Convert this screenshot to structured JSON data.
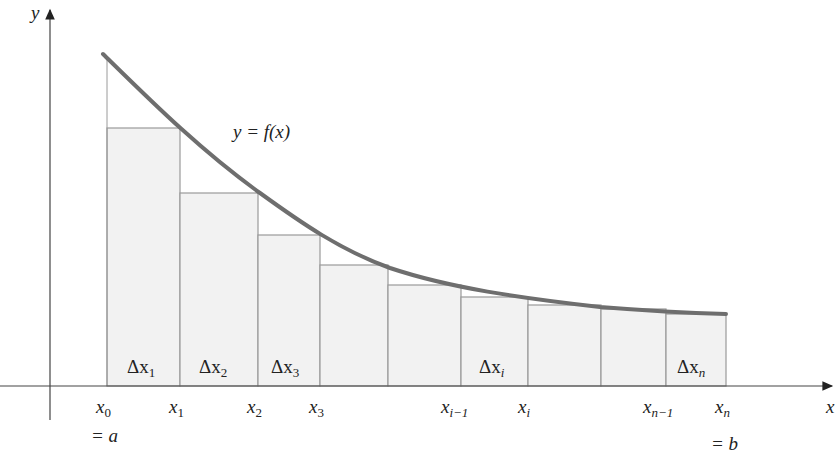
{
  "diagram": {
    "type": "riemann-sum-right-endpoints",
    "curve_label": "y = f(x)",
    "axes": {
      "x_label": "x",
      "y_label": "y"
    },
    "colors": {
      "curve": "#6e6e6e",
      "rect_fill": "#f2f2f2",
      "rect_stroke": "#9a9a9a",
      "axis": "#555555"
    },
    "partition_ticks": [
      {
        "base": "x",
        "sub": "0"
      },
      {
        "base": "x",
        "sub": "1"
      },
      {
        "base": "x",
        "sub": "2"
      },
      {
        "base": "x",
        "sub": "3"
      },
      {
        "base": "x",
        "sub": "i−1"
      },
      {
        "base": "x",
        "sub": "i"
      },
      {
        "base": "x",
        "sub": "n−1"
      },
      {
        "base": "x",
        "sub": "n"
      }
    ],
    "endpoint_notes": {
      "left": "= a",
      "right": "= b"
    },
    "width_labels": [
      {
        "text": "Δx",
        "sub": "1"
      },
      {
        "text": "Δx",
        "sub": "2"
      },
      {
        "text": "Δx",
        "sub": "3"
      },
      {
        "text": "Δx",
        "sub": "i"
      },
      {
        "text": "Δx",
        "sub": "n"
      }
    ],
    "rectangles": [
      {
        "x0": 107,
        "x1": 180,
        "top": 128
      },
      {
        "x0": 180,
        "x1": 258,
        "top": 193
      },
      {
        "x0": 258,
        "x1": 320,
        "top": 235
      },
      {
        "x0": 320,
        "x1": 388,
        "top": 265
      },
      {
        "x0": 388,
        "x1": 461,
        "top": 285
      },
      {
        "x0": 461,
        "x1": 528,
        "top": 297
      },
      {
        "x0": 528,
        "x1": 601,
        "top": 305
      },
      {
        "x0": 601,
        "x1": 666,
        "top": 309
      },
      {
        "x0": 666,
        "x1": 726,
        "top": 314
      }
    ]
  }
}
